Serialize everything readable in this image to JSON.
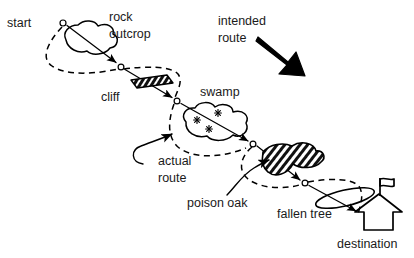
{
  "diagram": {
    "background_color": "#ffffff",
    "ink_color": "#000000"
  },
  "labels": {
    "start": "start",
    "rock_outcrop_line1": "rock",
    "rock_outcrop_line2": "outcrop",
    "cliff": "cliff",
    "intended_route_line1": "intended",
    "intended_route_line2": "route",
    "swamp": "swamp",
    "actual_route_line1": "actual",
    "actual_route_line2": "route",
    "poison_oak": "poison oak",
    "fallen_tree": "fallen tree",
    "destination": "destination"
  },
  "legend": {
    "intended_route_style": "solid line with arrowheads and open circle waypoints",
    "actual_route_style": "dashed line detouring around obstacles"
  },
  "obstacles": [
    {
      "name": "rock outcrop",
      "symbol": "irregular closed blob outline"
    },
    {
      "name": "cliff",
      "symbol": "dark hatched parallelogram"
    },
    {
      "name": "swamp",
      "symbol": "blob outline with marsh asterisk tufts"
    },
    {
      "name": "poison oak",
      "symbol": "hatched blob"
    },
    {
      "name": "fallen tree",
      "symbol": "elongated slanted oval"
    }
  ],
  "markers": {
    "start_point": "open circle at start",
    "destination_symbol": "house outline with flag",
    "intended_route_arrow": "thick solid black arrow pointing down-right"
  },
  "waypoints": [
    {
      "id": "w0",
      "x": 63,
      "y": 23
    },
    {
      "id": "w1",
      "x": 121,
      "y": 67
    },
    {
      "id": "w2",
      "x": 177,
      "y": 101
    },
    {
      "id": "w3",
      "x": 253,
      "y": 144
    },
    {
      "id": "w4",
      "x": 305,
      "y": 183
    },
    {
      "id": "w5",
      "x": 363,
      "y": 212
    }
  ]
}
